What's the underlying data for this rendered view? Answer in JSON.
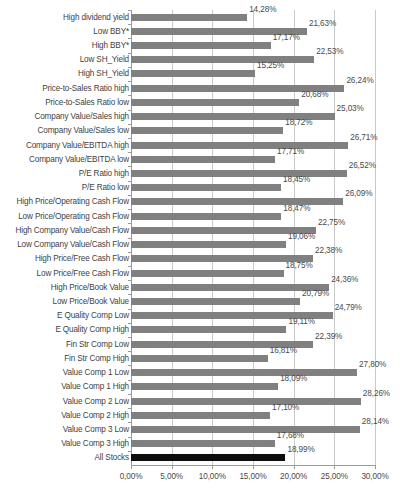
{
  "chart_data": {
    "type": "bar",
    "orientation": "horizontal",
    "title": "",
    "subtitle": "",
    "xlabel": "",
    "ylabel": "",
    "xlim": [
      0,
      30
    ],
    "grid": true,
    "legend": false,
    "legend_position": "none",
    "value_suffix": "%",
    "decimal_separator": ",",
    "bar_color": "#808080",
    "highlight_color": "#0d0d0d",
    "highlight_category": "All Stocks",
    "xticks": [
      0,
      5,
      10,
      15,
      20,
      25,
      30
    ],
    "xtick_labels": [
      "0,00%",
      "5,00%",
      "10,00%",
      "15,00%",
      "20,00%",
      "25,00%",
      "30,00%"
    ],
    "categories": [
      "High dividend yield",
      "Low BBY*",
      "High BBY*",
      "Low SH_Yield",
      "High SH_Yield",
      "Price-to-Sales Ratio high",
      "Price-to-Sales Ratio low",
      "Company Value/Sales high",
      "Company Value/Sales low",
      "Company Value/EBITDA high",
      "Company Value/EBITDA low",
      "P/E Ratio high",
      "P/E Ratio low",
      "High Price/Operating Cash Flow",
      "Low Price/Operating Cash Flow",
      "High Company Value/Cash Flow",
      "Low Company Value/Cash Flow",
      "High Price/Free Cash Flow",
      "Low Price/Free Cash Flow",
      "High Price/Book Value",
      "Low Price/Book Value",
      "E Quality Comp Low",
      "E Quality Comp High",
      "Fin Str Comp Low",
      "Fin Str Comp High",
      "Value Comp 1 Low",
      "Value Comp 1 High",
      "Value Comp 2 Low",
      "Value Comp 2 High",
      "Value Comp 3 Low",
      "Value Comp 3 High",
      "All Stocks"
    ],
    "values": [
      14.28,
      21.63,
      17.17,
      22.53,
      15.25,
      26.24,
      20.68,
      25.03,
      18.72,
      26.71,
      17.71,
      26.52,
      18.45,
      26.09,
      18.47,
      22.75,
      19.06,
      22.38,
      18.75,
      24.36,
      20.79,
      24.79,
      19.11,
      22.39,
      16.81,
      27.8,
      18.09,
      28.26,
      17.1,
      28.14,
      17.68,
      18.99
    ],
    "value_labels": [
      "14,28%",
      "21,63%",
      "17,17%",
      "22,53%",
      "15,25%",
      "26,24%",
      "20,68%",
      "25,03%",
      "18,72%",
      "26,71%",
      "17,71%",
      "26,52%",
      "18,45%",
      "26,09%",
      "18,47%",
      "22,75%",
      "19,06%",
      "22,38%",
      "18,75%",
      "24,36%",
      "20,79%",
      "24,79%",
      "19,11%",
      "22,39%",
      "16,81%",
      "27,80%",
      "18,09%",
      "28,26%",
      "17,10%",
      "28,14%",
      "17,68%",
      "18,99%"
    ]
  }
}
